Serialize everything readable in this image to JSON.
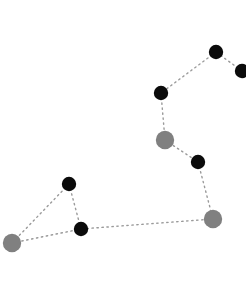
{
  "canvas": {
    "width": 246,
    "height": 290,
    "background_color": "#ffffff",
    "title": "node-link-diagram"
  },
  "style": {
    "edge_color": "#9a9a9a",
    "edge_width": 1.4,
    "edge_dash": "1.4 3.6",
    "node_dark_color": "#0b0b0b",
    "node_gray_color": "#808080",
    "node_dark_radius": 7.2,
    "node_gray_radius": 9.2
  },
  "chart_data": {
    "type": "scatter",
    "title": "",
    "xlabel": "",
    "ylabel": "",
    "xlim": [
      0,
      246
    ],
    "ylim": [
      0,
      290
    ],
    "grid": false,
    "legend": "none",
    "nodes": [
      {
        "id": "n1",
        "label": "top-right-upper",
        "x": 216,
        "y": 52,
        "color": "#0b0b0b",
        "r": 7.2,
        "group": "dark"
      },
      {
        "id": "n2",
        "label": "far-right-edge",
        "x": 242,
        "y": 71,
        "color": "#0b0b0b",
        "r": 7.2,
        "group": "dark"
      },
      {
        "id": "n3",
        "label": "upper-middle",
        "x": 161,
        "y": 93,
        "color": "#0b0b0b",
        "r": 7.2,
        "group": "dark"
      },
      {
        "id": "n4",
        "label": "center-gray",
        "x": 165,
        "y": 140,
        "color": "#808080",
        "r": 9.2,
        "group": "gray"
      },
      {
        "id": "n5",
        "label": "right-middle",
        "x": 198,
        "y": 162,
        "color": "#0b0b0b",
        "r": 7.2,
        "group": "dark"
      },
      {
        "id": "n6",
        "label": "lower-right-gray",
        "x": 213,
        "y": 219,
        "color": "#808080",
        "r": 9.2,
        "group": "gray"
      },
      {
        "id": "n7",
        "label": "left-upper",
        "x": 69,
        "y": 184,
        "color": "#0b0b0b",
        "r": 7.2,
        "group": "dark"
      },
      {
        "id": "n8",
        "label": "left-lower",
        "x": 81,
        "y": 229,
        "color": "#0b0b0b",
        "r": 7.2,
        "group": "dark"
      },
      {
        "id": "n9",
        "label": "far-left-gray",
        "x": 12,
        "y": 243,
        "color": "#808080",
        "r": 9.2,
        "group": "gray"
      }
    ],
    "edges": [
      {
        "from": "n2",
        "to": "n1"
      },
      {
        "from": "n1",
        "to": "n3"
      },
      {
        "from": "n3",
        "to": "n4"
      },
      {
        "from": "n4",
        "to": "n5"
      },
      {
        "from": "n5",
        "to": "n6"
      },
      {
        "from": "n6",
        "to": "n8"
      },
      {
        "from": "n8",
        "to": "n7"
      },
      {
        "from": "n7",
        "to": "n9"
      },
      {
        "from": "n9",
        "to": "n8"
      }
    ]
  }
}
